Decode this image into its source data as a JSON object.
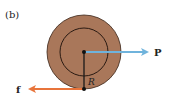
{
  "figure": {
    "panel_label": "(b)",
    "labels": {
      "force_p": "P",
      "force_f": "f",
      "radius": "R"
    },
    "colors": {
      "disk_fill": "#a9775a",
      "disk_stroke": "#3a2418",
      "inner_circle": "#2a1a12",
      "radius_line": "#1a1a1a",
      "arrow_p": "#6fb3dc",
      "arrow_f": "#e8743b",
      "text": "#222222"
    }
  }
}
